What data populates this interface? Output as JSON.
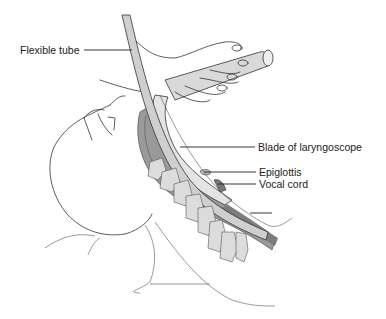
{
  "figure": {
    "labels": [
      {
        "id": "flexible-tube",
        "text": "Flexible tube"
      },
      {
        "id": "blade",
        "text": "Blade of laryngoscope"
      },
      {
        "id": "epiglottis",
        "text": "Epiglottis"
      },
      {
        "id": "vocal-cord",
        "text": "Vocal cord"
      }
    ]
  },
  "colors": {
    "line": "#333333",
    "tube_fill": "#d6d6d6",
    "airway_dark": "#8a8a8a",
    "vertebra_fill": "#dcdcdc",
    "background": "#ffffff"
  }
}
